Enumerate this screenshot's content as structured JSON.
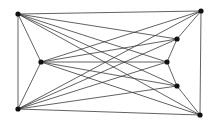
{
  "diagram": {
    "type": "graph",
    "nodes": [
      {
        "id": "TL",
        "x": 18,
        "y": 14
      },
      {
        "id": "LM",
        "x": 41,
        "y": 62
      },
      {
        "id": "BL",
        "x": 18,
        "y": 109
      },
      {
        "id": "TR",
        "x": 201,
        "y": 11
      },
      {
        "id": "R1",
        "x": 177,
        "y": 39
      },
      {
        "id": "R2",
        "x": 167,
        "y": 62
      },
      {
        "id": "R3",
        "x": 177,
        "y": 86
      },
      {
        "id": "BR",
        "x": 200,
        "y": 115
      }
    ],
    "edges": [
      [
        "TL",
        "BL"
      ],
      [
        "TL",
        "LM"
      ],
      [
        "LM",
        "BL"
      ],
      [
        "TR",
        "BR"
      ],
      [
        "TR",
        "R1"
      ],
      [
        "R1",
        "R2"
      ],
      [
        "R2",
        "R3"
      ],
      [
        "R3",
        "BR"
      ],
      [
        "TL",
        "TR"
      ],
      [
        "TL",
        "R1"
      ],
      [
        "TL",
        "R2"
      ],
      [
        "TL",
        "R3"
      ],
      [
        "TL",
        "BR"
      ],
      [
        "LM",
        "TR"
      ],
      [
        "LM",
        "R1"
      ],
      [
        "LM",
        "R2"
      ],
      [
        "LM",
        "R3"
      ],
      [
        "LM",
        "BR"
      ],
      [
        "BL",
        "TR"
      ],
      [
        "BL",
        "R1"
      ],
      [
        "BL",
        "R2"
      ],
      [
        "BL",
        "R3"
      ],
      [
        "BL",
        "BR"
      ]
    ],
    "colors": {
      "edge": "#3a3a3a",
      "node": "#111111",
      "background": "#ffffff"
    }
  }
}
